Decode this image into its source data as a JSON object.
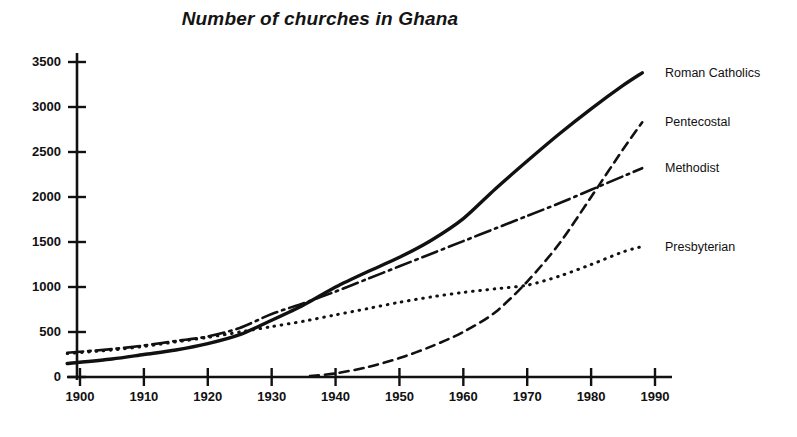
{
  "chart_data": {
    "type": "line",
    "title": "Number of churches in Ghana",
    "xlabel": "",
    "ylabel": "",
    "xlim": [
      1898,
      1990
    ],
    "ylim": [
      0,
      3600
    ],
    "grid": false,
    "legend_position": "right-of-plot-end-labels",
    "x_ticks": [
      1900,
      1910,
      1920,
      1930,
      1940,
      1950,
      1960,
      1970,
      1980,
      1990
    ],
    "x_tick_labels": [
      "1900",
      "1910",
      "1920",
      "1930",
      "1940",
      "1950",
      "1960",
      "1970",
      "1980",
      "1990"
    ],
    "y_ticks": [
      0,
      500,
      1000,
      1500,
      2000,
      2500,
      3000,
      3500
    ],
    "y_tick_labels": [
      "0",
      "500",
      "1000",
      "1500",
      "2000",
      "2500",
      "3000",
      "3500"
    ],
    "series": [
      {
        "name": "Roman Catholics",
        "style": "solid",
        "color": "#111111",
        "x": [
          1898,
          1905,
          1910,
          1915,
          1920,
          1925,
          1930,
          1935,
          1940,
          1945,
          1950,
          1955,
          1960,
          1965,
          1970,
          1975,
          1980,
          1985,
          1988
        ],
        "values": [
          150,
          200,
          250,
          300,
          370,
          470,
          630,
          800,
          1000,
          1170,
          1330,
          1520,
          1760,
          2090,
          2400,
          2700,
          2980,
          3240,
          3380
        ]
      },
      {
        "name": "Pentecostal",
        "style": "dashed",
        "color": "#111111",
        "x": [
          1936,
          1940,
          1945,
          1950,
          1955,
          1960,
          1965,
          1970,
          1975,
          1980,
          1985,
          1988
        ],
        "values": [
          10,
          40,
          110,
          210,
          340,
          500,
          720,
          1060,
          1480,
          2000,
          2530,
          2830
        ]
      },
      {
        "name": "Methodist",
        "style": "dashdot",
        "color": "#111111",
        "x": [
          1898,
          1905,
          1910,
          1915,
          1920,
          1925,
          1930,
          1935,
          1940,
          1945,
          1950,
          1955,
          1960,
          1965,
          1970,
          1975,
          1980,
          1985,
          1988
        ],
        "values": [
          270,
          310,
          350,
          400,
          450,
          545,
          700,
          820,
          950,
          1090,
          1230,
          1370,
          1510,
          1650,
          1790,
          1930,
          2080,
          2230,
          2320
        ]
      },
      {
        "name": "Presbyterian",
        "style": "dotted",
        "color": "#111111",
        "x": [
          1898,
          1905,
          1910,
          1915,
          1920,
          1925,
          1930,
          1935,
          1940,
          1945,
          1950,
          1955,
          1960,
          1965,
          1970,
          1975,
          1980,
          1985,
          1988
        ],
        "values": [
          260,
          300,
          340,
          390,
          440,
          500,
          560,
          620,
          690,
          760,
          830,
          890,
          940,
          980,
          1020,
          1120,
          1250,
          1390,
          1450
        ]
      }
    ],
    "end_labels": [
      {
        "name": "Roman Catholics",
        "x": 1990,
        "value": 3380
      },
      {
        "name": "Pentecostal",
        "x": 1990,
        "value": 2830
      },
      {
        "name": "Methodist",
        "x": 1990,
        "value": 2320
      },
      {
        "name": "Presbyterian",
        "x": 1990,
        "value": 1450
      }
    ]
  },
  "labels": {
    "roman_catholics": "Roman Catholics",
    "pentecostal": "Pentecostal",
    "methodist": "Methodist",
    "presbyterian": "Presbyterian"
  },
  "colors": {
    "ink": "#111111",
    "background": "#ffffff"
  }
}
